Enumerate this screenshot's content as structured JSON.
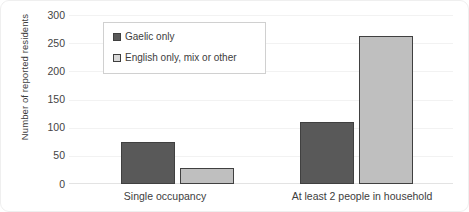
{
  "chart_data": {
    "type": "bar",
    "title": "",
    "xlabel": "",
    "ylabel": "Number of reported residents",
    "categories": [
      "Single occupancy",
      "At least 2 people in household"
    ],
    "series": [
      {
        "name": "Gaelic only",
        "color": "#595959",
        "values": [
          75,
          110
        ]
      },
      {
        "name": "English only, mix or other",
        "color": "#bfbfbf",
        "values": [
          28,
          264
        ]
      }
    ],
    "ylim": [
      0,
      300
    ],
    "yticks": [
      300,
      250,
      200,
      150,
      100,
      50,
      0
    ],
    "grid": true,
    "legend_position": "top-left-inside"
  },
  "legend": {
    "items": [
      {
        "label": "Gaelic only"
      },
      {
        "label": "English only, mix or other"
      }
    ]
  },
  "axis": {
    "y_title": "Number of reported residents",
    "y_tick_labels": [
      "300",
      "250",
      "200",
      "150",
      "100",
      "50",
      "0"
    ],
    "x_tick_labels": [
      "Single occupancy",
      "At least 2 people in household"
    ]
  }
}
